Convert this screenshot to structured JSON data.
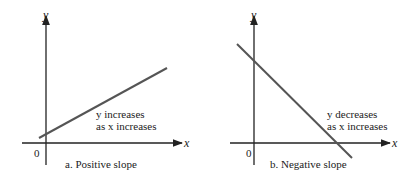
{
  "panels": [
    {
      "id": "a",
      "caption": "a.  Positive slope",
      "y_axis_label": "y",
      "x_axis_label": "x",
      "origin_label": "0",
      "annotation_line1": "y increases",
      "annotation_line2": "as x increases",
      "slope": "positive"
    },
    {
      "id": "b",
      "caption": "b.  Negative slope",
      "y_axis_label": "y",
      "x_axis_label": "x",
      "origin_label": "0",
      "annotation_line1": "y decreases",
      "annotation_line2": "as x increases",
      "slope": "negative"
    }
  ],
  "colors": {
    "axis": "#222222",
    "line": "#555555",
    "text": "#222222"
  }
}
